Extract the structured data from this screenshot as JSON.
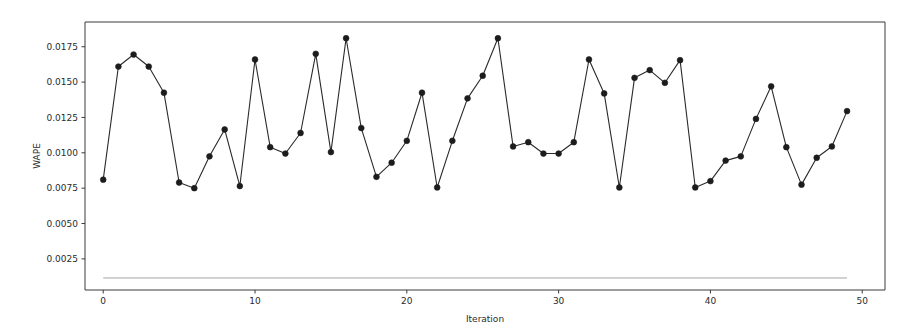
{
  "chart_data": {
    "type": "line",
    "title": "",
    "xlabel": "Iteration",
    "ylabel": "WAPE",
    "xlim": [
      -1.2,
      51.5
    ],
    "ylim": [
      0.0003,
      0.01925
    ],
    "grid": false,
    "legend": "none",
    "xticks": [
      0,
      10,
      20,
      30,
      40,
      50
    ],
    "xticklabels": [
      "0",
      "10",
      "20",
      "30",
      "40",
      "50"
    ],
    "yticks": [
      0.0025,
      0.005,
      0.0075,
      0.01,
      0.0125,
      0.015,
      0.0175
    ],
    "yticklabels": [
      "0.0025",
      "0.0050",
      "0.0075",
      "0.0100",
      "0.0125",
      "0.0150",
      "0.0175"
    ],
    "series": [
      {
        "name": "WAPE",
        "marker": "circle",
        "color": "#1c1c1c",
        "x": [
          0,
          1,
          2,
          3,
          4,
          5,
          6,
          7,
          8,
          9,
          10,
          11,
          12,
          13,
          14,
          15,
          16,
          17,
          18,
          19,
          20,
          21,
          22,
          23,
          24,
          25,
          26,
          27,
          28,
          29,
          30,
          31,
          32,
          33,
          34,
          35,
          36,
          37,
          38,
          39,
          40,
          41,
          42,
          43,
          44,
          45,
          46,
          47,
          48,
          49
        ],
        "values": [
          0.0081,
          0.0161,
          0.01695,
          0.0161,
          0.01425,
          0.0079,
          0.0075,
          0.00975,
          0.01165,
          0.00765,
          0.0166,
          0.0104,
          0.00995,
          0.0114,
          0.017,
          0.01005,
          0.0181,
          0.01175,
          0.0083,
          0.0093,
          0.01085,
          0.01425,
          0.00755,
          0.01085,
          0.01385,
          0.01545,
          0.0181,
          0.01045,
          0.01075,
          0.00995,
          0.00995,
          0.01075,
          0.0166,
          0.0142,
          0.00755,
          0.0153,
          0.01585,
          0.01495,
          0.01655,
          0.00755,
          0.008,
          0.00945,
          0.00975,
          0.0124,
          0.0147,
          0.0104,
          0.00775,
          0.00965,
          0.01045,
          0.01295
        ]
      },
      {
        "name": "baseline",
        "marker": "none",
        "color": "#9a9a9a",
        "x": [
          0,
          49
        ],
        "values": [
          0.00115,
          0.00115
        ]
      }
    ]
  },
  "figure": {
    "axes_background": "#ffffff",
    "spine_color": "#3a3a3a",
    "text_color": "#2b2b2b"
  }
}
